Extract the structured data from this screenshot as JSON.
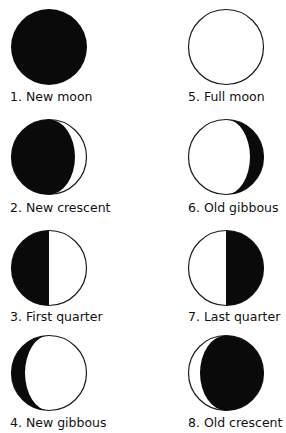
{
  "colors": {
    "dark": "#0a0a0a",
    "light": "#ffffff",
    "outline": "#1a1a1a"
  },
  "phases": [
    {
      "number": 1,
      "label": "1. New moon",
      "dark_side": "full",
      "column": "left",
      "row": 1
    },
    {
      "number": 2,
      "label": "2. New crescent",
      "dark_side": "left-crescent-lit-right",
      "column": "left",
      "row": 2
    },
    {
      "number": 3,
      "label": "3. First quarter",
      "dark_side": "left-half",
      "column": "left",
      "row": 3
    },
    {
      "number": 4,
      "label": "4. New gibbous",
      "dark_side": "left-sliver",
      "column": "left",
      "row": 4
    },
    {
      "number": 5,
      "label": "5. Full moon",
      "dark_side": "none",
      "column": "right",
      "row": 1
    },
    {
      "number": 6,
      "label": "6. Old gibbous",
      "dark_side": "right-sliver",
      "column": "right",
      "row": 2
    },
    {
      "number": 7,
      "label": "7. Last quarter",
      "dark_side": "right-half",
      "column": "right",
      "row": 3
    },
    {
      "number": 8,
      "label": "8. Old crescent",
      "dark_side": "right-crescent-lit-left",
      "column": "right",
      "row": 4
    }
  ]
}
